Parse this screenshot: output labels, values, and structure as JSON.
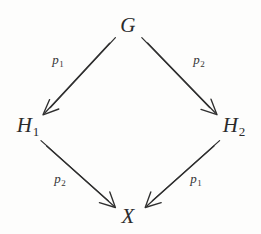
{
  "diagram": {
    "kind": "commutative-diagram",
    "shape": "diamond",
    "background_color": "#fdfdfc",
    "stroke_color": "#2f2f2f",
    "text_color": "#2b2b2b",
    "nodes": [
      {
        "id": "G",
        "base": "G",
        "sub": "",
        "x": 128,
        "y": 25,
        "position": "top"
      },
      {
        "id": "H1",
        "base": "H",
        "sub": "1",
        "x": 28,
        "y": 126,
        "position": "left"
      },
      {
        "id": "H2",
        "base": "H",
        "sub": "2",
        "x": 234,
        "y": 126,
        "position": "right"
      },
      {
        "id": "X",
        "base": "X",
        "sub": "",
        "x": 128,
        "y": 216,
        "position": "bottom"
      }
    ],
    "edges": [
      {
        "id": "G-H1",
        "from": "G",
        "to": "H1",
        "label_base": "p",
        "label_sub": "1",
        "label_x": 58,
        "label_y": 61,
        "x1": 112,
        "y1": 40,
        "x2": 47,
        "y2": 110,
        "arrow_style": "double-line-open-head"
      },
      {
        "id": "G-H2",
        "from": "G",
        "to": "H2",
        "label_base": "p",
        "label_sub": "2",
        "label_x": 199,
        "label_y": 61,
        "x1": 145,
        "y1": 40,
        "x2": 213,
        "y2": 110,
        "arrow_style": "double-line-open-head"
      },
      {
        "id": "H1-X",
        "from": "H1",
        "to": "X",
        "label_base": "p",
        "label_sub": "2",
        "label_x": 60,
        "label_y": 180,
        "x1": 44,
        "y1": 143,
        "x2": 111,
        "y2": 203,
        "arrow_style": "double-line-open-head"
      },
      {
        "id": "H2-X",
        "from": "H2",
        "to": "X",
        "label_base": "p",
        "label_sub": "1",
        "label_x": 196,
        "label_y": 180,
        "x1": 216,
        "y1": 143,
        "x2": 148,
        "y2": 203,
        "arrow_style": "double-line-open-head"
      }
    ]
  }
}
